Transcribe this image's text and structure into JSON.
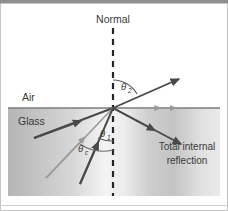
{
  "figure": {
    "name": "total-internal-reflection-diagram",
    "caption_labels": {
      "normal": "Normal",
      "air": "Air",
      "glass": "Glass",
      "total_internal_reflection_line1": "Total internal",
      "total_internal_reflection_line2": "reflection"
    },
    "angles": {
      "theta2": {
        "symbol": "θ",
        "subscript": "2"
      },
      "theta1": {
        "symbol": "θ",
        "subscript": "1"
      },
      "theta_c": {
        "symbol": "θ",
        "subscript": "c"
      }
    },
    "colors": {
      "border": "#a8a8a8",
      "top_bar": "#8c8c8c",
      "glass_fill_dark": "#b9b9b9",
      "glass_fill_light": "#f2f2f2",
      "interface_line": "#7b7b7b",
      "ray_dark": "#4a4a4a",
      "ray_light": "#9a9a9a",
      "normal_dash": "#2b2b2b",
      "text": "#3a3a3a",
      "background": "#ffffff"
    },
    "geometry": {
      "incidence_point": {
        "x": 113,
        "y": 108
      },
      "interface_y": 108,
      "glass_top_y": 108,
      "glass_bottom_y": 196,
      "glass_left_x": 8,
      "glass_right_x": 220,
      "normal_x": 113,
      "normal_top_y": 28,
      "normal_bottom_y": 196
    },
    "rays": [
      {
        "name": "refracted-ray",
        "from": [
          113,
          108
        ],
        "to": [
          178,
          79
        ],
        "tone": "ray_dark",
        "arrow": true
      },
      {
        "name": "grazing-ray-along-interface",
        "from": [
          113,
          108
        ],
        "to": [
          172,
          108
        ],
        "tone": "ray_light",
        "arrow": true
      },
      {
        "name": "reflected-ray-total-internal",
        "from": [
          113,
          108
        ],
        "to": [
          180,
          143
        ],
        "tone": "ray_dark",
        "arrow": true
      },
      {
        "name": "incident-ray-shallow",
        "from": [
          36,
          137
        ],
        "to": [
          113,
          108
        ],
        "tone": "ray_dark",
        "arrow": true
      },
      {
        "name": "incident-ray-critical",
        "from": [
          46,
          176
        ],
        "to": [
          113,
          108
        ],
        "tone": "ray_light",
        "arrow": true
      },
      {
        "name": "incident-ray-steep",
        "from": [
          80,
          182
        ],
        "to": [
          113,
          108
        ],
        "tone": "ray_dark",
        "arrow": true
      }
    ]
  }
}
